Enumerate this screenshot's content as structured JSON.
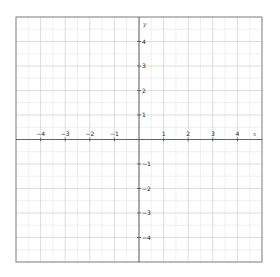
{
  "chart_data": {
    "type": "line",
    "title": "",
    "xlabel": "x",
    "ylabel": "y",
    "xlim": [
      -5,
      5
    ],
    "ylim": [
      -5,
      5
    ],
    "grid": true,
    "minor_grid_step": 0.5,
    "major_grid_step": 1,
    "x_ticks": [
      -4,
      -3,
      -2,
      -1,
      1,
      2,
      3,
      4
    ],
    "y_ticks": [
      -4,
      -3,
      -2,
      -1,
      1,
      2,
      3,
      4
    ],
    "x_tick_labels": [
      "−4",
      "−3",
      "−2",
      "−1",
      "1",
      "2",
      "3",
      "4"
    ],
    "y_tick_labels": [
      "−4",
      "−3",
      "−2",
      "−1",
      "1",
      "2",
      "3",
      "4"
    ],
    "series": [],
    "legend": null
  },
  "colors": {
    "background": "#ffffff",
    "border": "#8a8a8a",
    "major_grid": "#c8c8c8",
    "minor_grid": "#e6e6e6",
    "axis": "#444444",
    "text": "#222222"
  }
}
